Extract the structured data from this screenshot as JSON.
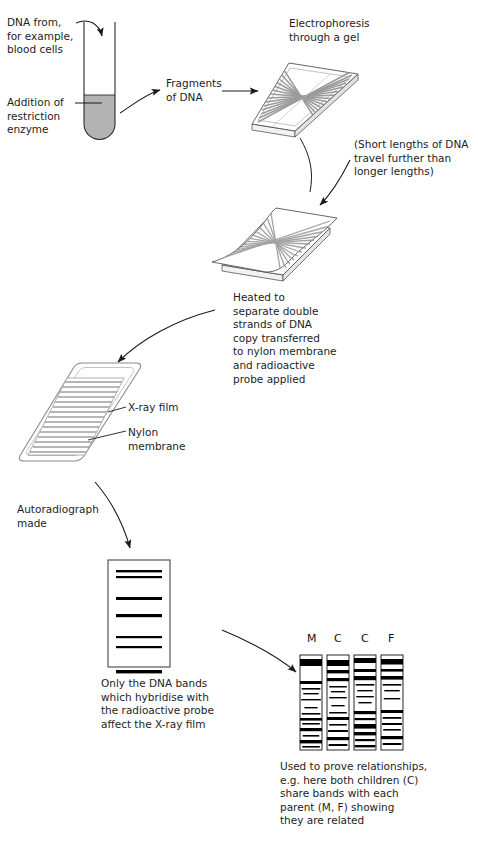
{
  "diagram": {
    "ink": "#1a1a1a",
    "tube_fill": "#b3b3b3",
    "band_color": "#000000",
    "gel_band_color": "#9a9a9a"
  },
  "labels": {
    "source": "DNA from,\nfor example,\nblood cells",
    "restriction": "Addition of\nrestriction\nenzyme",
    "fragments": "Fragments\nof DNA",
    "electrophoresis": "Electrophoresis\nthrough a gel",
    "travel_note": "(Short lengths of DNA\ntravel further than\nlonger lengths)",
    "heated": "Heated to\nseparate double\nstrands of DNA\ncopy transferred\nto nylon membrane\nand radioactive\nprobe applied",
    "xray_film": "X-ray film",
    "nylon_membrane": "Nylon\nmembrane",
    "autoradiograph": "Autoradiograph\nmade",
    "only_bands": "Only the DNA bands\nwhich hybridise with\nthe radioactive probe\naffect the X-ray film",
    "relationships": "Used to prove relationships,\ne.g. here both children (C)\nshare bands with each\nparent (M, F) showing\nthey are related"
  },
  "fingerprint": {
    "lane_labels": [
      "M",
      "C",
      "C",
      "F"
    ],
    "lanes": [
      {
        "name": "M",
        "bands": [
          {
            "y": 4,
            "h": 7,
            "w": 1.0
          },
          {
            "y": 26,
            "h": 3,
            "w": 1.0
          },
          {
            "y": 33,
            "h": 1.6,
            "w": 0.85
          },
          {
            "y": 38,
            "h": 1.4,
            "w": 0.7
          },
          {
            "y": 44,
            "h": 1.4,
            "w": 0.9
          },
          {
            "y": 52,
            "h": 1.4,
            "w": 0.6
          },
          {
            "y": 58,
            "h": 1.6,
            "w": 0.85
          },
          {
            "y": 63,
            "h": 2.6,
            "w": 1.0
          },
          {
            "y": 68,
            "h": 1.6,
            "w": 0.8
          },
          {
            "y": 73,
            "h": 3.2,
            "w": 1.0
          },
          {
            "y": 80,
            "h": 1.6,
            "w": 0.75
          },
          {
            "y": 85,
            "h": 3.4,
            "w": 1.0
          },
          {
            "y": 91,
            "h": 1.6,
            "w": 0.8
          }
        ]
      },
      {
        "name": "C",
        "bands": [
          {
            "y": 5,
            "h": 6,
            "w": 1.0
          },
          {
            "y": 15,
            "h": 3.4,
            "w": 1.0
          },
          {
            "y": 23,
            "h": 3.2,
            "w": 1.0
          },
          {
            "y": 31,
            "h": 1.5,
            "w": 0.8
          },
          {
            "y": 36,
            "h": 1.4,
            "w": 0.65
          },
          {
            "y": 42,
            "h": 1.4,
            "w": 0.8
          },
          {
            "y": 50,
            "h": 1.4,
            "w": 0.6
          },
          {
            "y": 57,
            "h": 1.5,
            "w": 0.8
          },
          {
            "y": 62,
            "h": 3.0,
            "w": 1.0
          },
          {
            "y": 69,
            "h": 1.6,
            "w": 0.8
          },
          {
            "y": 75,
            "h": 2.0,
            "w": 0.9
          },
          {
            "y": 82,
            "h": 3.2,
            "w": 1.0
          },
          {
            "y": 89,
            "h": 2.0,
            "w": 0.85
          }
        ]
      },
      {
        "name": "C",
        "bands": [
          {
            "y": 3,
            "h": 5,
            "w": 1.0
          },
          {
            "y": 14,
            "h": 3.0,
            "w": 1.0
          },
          {
            "y": 21,
            "h": 4.2,
            "w": 1.0
          },
          {
            "y": 29,
            "h": 1.6,
            "w": 0.85
          },
          {
            "y": 35,
            "h": 1.4,
            "w": 0.7
          },
          {
            "y": 41,
            "h": 1.4,
            "w": 0.8
          },
          {
            "y": 47,
            "h": 1.4,
            "w": 0.6
          },
          {
            "y": 56,
            "h": 3.2,
            "w": 1.0
          },
          {
            "y": 63,
            "h": 2.2,
            "w": 0.95
          },
          {
            "y": 69,
            "h": 4.6,
            "w": 1.0
          },
          {
            "y": 77,
            "h": 3.4,
            "w": 1.0
          },
          {
            "y": 84,
            "h": 2.2,
            "w": 0.9
          },
          {
            "y": 90,
            "h": 2.4,
            "w": 0.95
          }
        ]
      },
      {
        "name": "F",
        "bands": [
          {
            "y": 4,
            "h": 5.5,
            "w": 1.0
          },
          {
            "y": 14,
            "h": 2.6,
            "w": 1.0
          },
          {
            "y": 21,
            "h": 3.6,
            "w": 1.0
          },
          {
            "y": 29,
            "h": 1.6,
            "w": 0.85
          },
          {
            "y": 35,
            "h": 1.4,
            "w": 0.7
          },
          {
            "y": 43,
            "h": 1.4,
            "w": 0.75
          },
          {
            "y": 55,
            "h": 3.0,
            "w": 1.0
          },
          {
            "y": 62,
            "h": 1.8,
            "w": 0.85
          },
          {
            "y": 68,
            "h": 2.0,
            "w": 0.9
          },
          {
            "y": 74,
            "h": 1.6,
            "w": 0.8
          },
          {
            "y": 81,
            "h": 3.2,
            "w": 1.0
          },
          {
            "y": 88,
            "h": 2.0,
            "w": 0.85
          }
        ]
      }
    ]
  },
  "autoradiograph_bands": [
    {
      "y": 10,
      "h": 2.4
    },
    {
      "y": 16,
      "h": 2.2
    },
    {
      "y": 37,
      "h": 3.0
    },
    {
      "y": 54,
      "h": 3.2
    },
    {
      "y": 76,
      "h": 2.2
    },
    {
      "y": 86,
      "h": 2.2
    },
    {
      "y": 110,
      "h": 3.4
    }
  ]
}
